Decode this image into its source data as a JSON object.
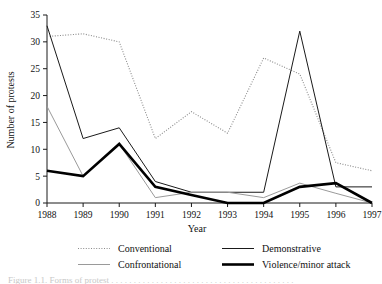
{
  "figure": {
    "background": "#ffffff",
    "caption_partial": "Figure 1.1. Forms of protest . . . . . . . . . . . . . . . . . . . . . . . . . . . . . . . . . . . . . . . . ."
  },
  "chart_data": {
    "type": "line",
    "title": "",
    "xlabel": "Year",
    "ylabel": "Number of protests",
    "categories": [
      "1988",
      "1989",
      "1990",
      "1991",
      "1992",
      "1993",
      "1994",
      "1995",
      "1996",
      "1997"
    ],
    "x": [
      1988,
      1989,
      1990,
      1991,
      1992,
      1993,
      1994,
      1995,
      1996,
      1997
    ],
    "xlim": [
      1988,
      1997
    ],
    "ylim": [
      0,
      35
    ],
    "yticks": [
      0,
      5,
      10,
      15,
      20,
      25,
      30,
      35
    ],
    "ytick_labels": [
      "0",
      "5",
      "10",
      "15",
      "20",
      "25",
      "30",
      "35"
    ],
    "grid": false,
    "legend_position": "below-axes",
    "series": [
      {
        "name": "Conventional",
        "style": "dotted",
        "color": "#8a8a8a",
        "width": 1.1,
        "values": [
          31,
          31.5,
          30,
          12,
          17,
          13,
          27,
          24,
          7.5,
          6
        ]
      },
      {
        "name": "Demonstrative",
        "style": "solid",
        "color": "#1a1a1a",
        "width": 1.0,
        "values": [
          33,
          12,
          14,
          4,
          2,
          2,
          2,
          32,
          3,
          3
        ]
      },
      {
        "name": "Confrontational",
        "style": "solid",
        "color": "#9a9a9a",
        "width": 1.0,
        "values": [
          18,
          5,
          11,
          1,
          2,
          2,
          1,
          3.7,
          1.8,
          0
        ]
      },
      {
        "name": "Violence/minor attack",
        "style": "solid-thick",
        "color": "#000000",
        "width": 2.6,
        "values": [
          6,
          5,
          11,
          3,
          1.5,
          0,
          0,
          3,
          3.7,
          0
        ]
      }
    ]
  },
  "legend": {
    "entries": [
      {
        "label": "Conventional",
        "swatch": "dotted-swatch"
      },
      {
        "label": "Demonstrative",
        "swatch": "thin-line-swatch"
      },
      {
        "label": "Confrontational",
        "swatch": "thin-gray-line-swatch"
      },
      {
        "label": "Violence/minor attack",
        "swatch": "thick-line-swatch"
      }
    ]
  }
}
